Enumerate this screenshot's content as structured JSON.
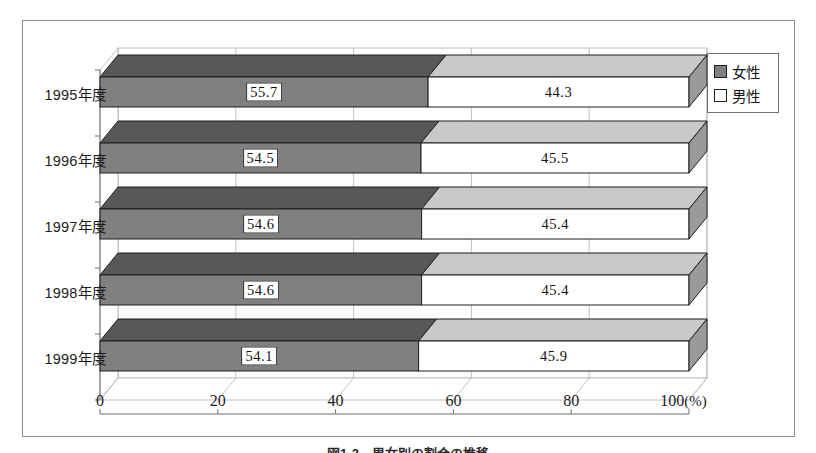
{
  "chart_data": {
    "type": "bar",
    "orientation": "horizontal",
    "stacked": true,
    "stacked_percent": true,
    "style": "3d",
    "title": "",
    "xlabel": "(%)",
    "ylabel": "",
    "categories": [
      "1995年度",
      "1996年度",
      "1997年度",
      "1998年度",
      "1999年度"
    ],
    "series": [
      {
        "name": "女性",
        "color": "#808080",
        "values": [
          55.7,
          54.5,
          54.6,
          54.6,
          54.1
        ],
        "labels": [
          "55.7",
          "54.5",
          "54.6",
          "54.6",
          "54.1"
        ],
        "label_style": "boxed"
      },
      {
        "name": "男性",
        "color": "#ffffff",
        "values": [
          44.3,
          45.5,
          45.4,
          45.4,
          45.9
        ],
        "labels": [
          "44.3",
          "45.5",
          "45.4",
          "45.4",
          "45.9"
        ],
        "label_style": "plain"
      }
    ],
    "xlim": [
      0,
      100
    ],
    "xticks": [
      0,
      20,
      40,
      60,
      80,
      100
    ],
    "xtick_labels": [
      "0",
      "20",
      "40",
      "60",
      "80",
      "100"
    ],
    "xtick_suffix_last": "(%)",
    "grid": true,
    "grid_axis": "x",
    "legend_position": "top-right",
    "legend_entries": [
      "女性",
      "男性"
    ]
  },
  "legend": {
    "female_label": "女性",
    "male_label": "男性"
  },
  "caption": {
    "text": "図1-2　男女別の割合の推移"
  },
  "colors": {
    "female_front": "#808080",
    "female_top": "#585858",
    "male_front": "#ffffff",
    "male_top": "#c9c9c9",
    "side_face": "#9a9a9a",
    "outline": "#1f1f1f",
    "frame": "#8d8d8d",
    "grid": "#b4b4b4"
  }
}
